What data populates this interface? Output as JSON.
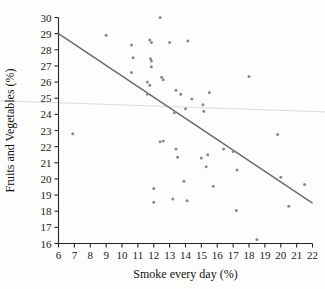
{
  "chart_data": {
    "type": "scatter",
    "title": "",
    "xlabel": "Smoke every day (%)",
    "ylabel": "Fruits and Vegetables (%)",
    "xlim": [
      6,
      22
    ],
    "ylim": [
      16,
      30
    ],
    "xticks": [
      6,
      7,
      8,
      9,
      10,
      11,
      12,
      13,
      14,
      15,
      16,
      17,
      18,
      19,
      20,
      21,
      22
    ],
    "yticks": [
      16,
      17,
      18,
      19,
      20,
      21,
      22,
      23,
      24,
      25,
      26,
      27,
      28,
      29,
      30
    ],
    "grid": false,
    "legend": "none",
    "marker_color": "#8a8a8a",
    "points": [
      {
        "x": 6.9,
        "y": 22.8
      },
      {
        "x": 9.0,
        "y": 28.9
      },
      {
        "x": 10.6,
        "y": 28.3
      },
      {
        "x": 10.7,
        "y": 27.5
      },
      {
        "x": 10.6,
        "y": 26.6
      },
      {
        "x": 11.75,
        "y": 28.6
      },
      {
        "x": 11.85,
        "y": 28.45
      },
      {
        "x": 11.8,
        "y": 27.45
      },
      {
        "x": 11.85,
        "y": 27.3
      },
      {
        "x": 11.85,
        "y": 26.95
      },
      {
        "x": 11.6,
        "y": 26.0
      },
      {
        "x": 11.75,
        "y": 25.8
      },
      {
        "x": 11.6,
        "y": 25.25
      },
      {
        "x": 12.4,
        "y": 30.0
      },
      {
        "x": 12.5,
        "y": 26.3
      },
      {
        "x": 12.6,
        "y": 26.15
      },
      {
        "x": 13.0,
        "y": 28.45
      },
      {
        "x": 13.4,
        "y": 25.5
      },
      {
        "x": 13.7,
        "y": 25.25
      },
      {
        "x": 14.15,
        "y": 28.55
      },
      {
        "x": 14.4,
        "y": 24.95
      },
      {
        "x": 14.0,
        "y": 24.35
      },
      {
        "x": 15.1,
        "y": 24.6
      },
      {
        "x": 15.15,
        "y": 24.2
      },
      {
        "x": 13.3,
        "y": 24.1
      },
      {
        "x": 15.5,
        "y": 25.35
      },
      {
        "x": 18.0,
        "y": 26.35
      },
      {
        "x": 12.4,
        "y": 22.3
      },
      {
        "x": 12.6,
        "y": 22.35
      },
      {
        "x": 13.4,
        "y": 21.85
      },
      {
        "x": 13.5,
        "y": 21.35
      },
      {
        "x": 15.0,
        "y": 21.3
      },
      {
        "x": 15.4,
        "y": 21.5
      },
      {
        "x": 15.3,
        "y": 20.75
      },
      {
        "x": 16.4,
        "y": 21.85
      },
      {
        "x": 17.0,
        "y": 21.7
      },
      {
        "x": 17.25,
        "y": 20.55
      },
      {
        "x": 13.9,
        "y": 19.85
      },
      {
        "x": 15.75,
        "y": 19.55
      },
      {
        "x": 12.0,
        "y": 19.4
      },
      {
        "x": 12.0,
        "y": 18.55
      },
      {
        "x": 13.2,
        "y": 18.75
      },
      {
        "x": 14.1,
        "y": 18.65
      },
      {
        "x": 17.2,
        "y": 18.05
      },
      {
        "x": 18.5,
        "y": 16.25
      },
      {
        "x": 19.8,
        "y": 22.75
      },
      {
        "x": 20.0,
        "y": 20.1
      },
      {
        "x": 20.5,
        "y": 18.3
      },
      {
        "x": 21.5,
        "y": 19.65
      }
    ],
    "lines": [
      {
        "name": "regression-line",
        "color": "#6e6e6e",
        "x0": 6,
        "y0": 29.0,
        "x1": 22,
        "y1": 18.5
      },
      {
        "name": "reference-line",
        "color": "#d8d8d8",
        "x0": 6,
        "y0": 24.72,
        "x1": 22,
        "y1": 24.18
      }
    ]
  }
}
